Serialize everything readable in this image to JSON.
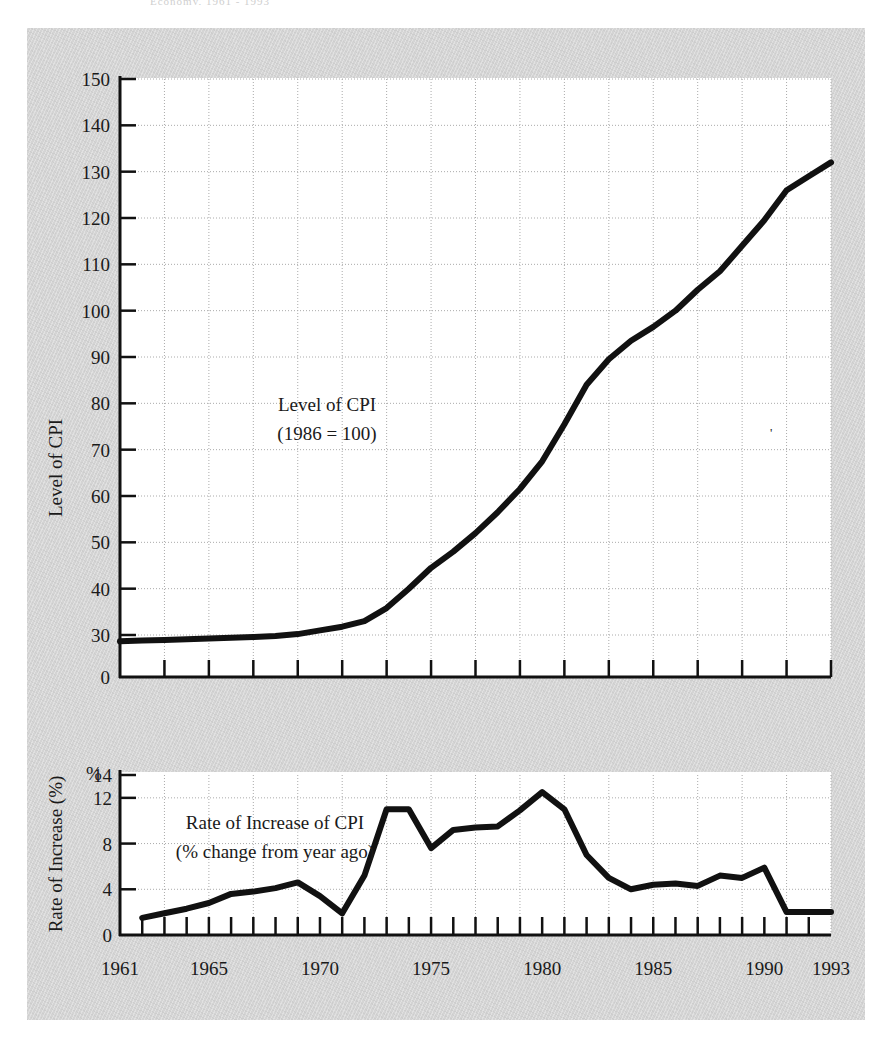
{
  "figure": {
    "cut_off_header": "Economy, 1961 - 1993",
    "background_color": "#d4d4d4",
    "plot_background": "#ffffff",
    "line_color": "#111111",
    "grid_color": "#aaaaaa"
  },
  "chart_data": [
    {
      "id": "level-of-cpi",
      "type": "line",
      "title": "Level of CPI",
      "subtitle": "(1986 = 100)",
      "xlabel": "",
      "ylabel": "Level of CPI",
      "ylim": [
        0,
        150
      ],
      "y_break_note": "axis compressed between 0 and 30",
      "yticks": [
        0,
        30,
        40,
        50,
        60,
        70,
        80,
        90,
        100,
        110,
        120,
        130,
        140,
        150
      ],
      "ytick_labels": [
        "0",
        "30",
        "40",
        "50",
        "60",
        "70",
        "80",
        "90",
        "100",
        "110",
        "120",
        "130",
        "140",
        "150"
      ],
      "xlim": [
        1961,
        1993
      ],
      "xticks": [
        1961,
        1963,
        1965,
        1967,
        1969,
        1971,
        1973,
        1975,
        1977,
        1979,
        1981,
        1983,
        1985,
        1987,
        1989,
        1991,
        1993
      ],
      "xtick_labels": [
        "1961",
        "",
        "1965",
        "",
        "",
        "",
        "",
        "1975",
        "",
        "",
        "",
        "",
        "1985",
        "",
        "",
        "",
        "1993"
      ],
      "grid": true,
      "x": [
        1961,
        1962,
        1963,
        1964,
        1965,
        1966,
        1967,
        1968,
        1969,
        1970,
        1971,
        1972,
        1973,
        1974,
        1975,
        1976,
        1977,
        1978,
        1979,
        1980,
        1981,
        1982,
        1983,
        1984,
        1985,
        1986,
        1987,
        1988,
        1989,
        1990,
        1991,
        1992,
        1993
      ],
      "values": [
        25.5,
        26.0,
        26.5,
        27.0,
        27.4,
        28.0,
        28.6,
        29.3,
        30.2,
        31.0,
        31.8,
        33.0,
        35.8,
        40.0,
        44.5,
        48.0,
        52.0,
        56.5,
        61.5,
        67.5,
        75.5,
        84.0,
        89.5,
        93.5,
        96.5,
        100.0,
        104.5,
        108.5,
        114.0,
        119.5,
        126.0,
        129.0,
        132.0
      ]
    },
    {
      "id": "rate-of-increase-of-cpi",
      "type": "line",
      "title": "Rate of Increase  of CPI",
      "subtitle": "(% change from year ago)",
      "xlabel": "",
      "ylabel": "Rate of Increase (%)",
      "unit_marker": "%",
      "ylim": [
        0,
        14
      ],
      "yticks": [
        0,
        4,
        8,
        12,
        14
      ],
      "ytick_labels": [
        "0",
        "4",
        "8",
        "12",
        "14"
      ],
      "xlim": [
        1961,
        1993
      ],
      "xticks": [
        1961,
        1962,
        1963,
        1964,
        1965,
        1966,
        1967,
        1968,
        1969,
        1970,
        1971,
        1972,
        1973,
        1974,
        1975,
        1976,
        1977,
        1978,
        1979,
        1980,
        1981,
        1982,
        1983,
        1984,
        1985,
        1986,
        1987,
        1988,
        1989,
        1990,
        1991,
        1992,
        1993
      ],
      "grid": true,
      "x": [
        1962,
        1963,
        1964,
        1965,
        1966,
        1967,
        1968,
        1969,
        1970,
        1971,
        1972,
        1973,
        1974,
        1975,
        1976,
        1977,
        1978,
        1979,
        1980,
        1981,
        1982,
        1983,
        1984,
        1985,
        1986,
        1987,
        1988,
        1989,
        1990,
        1991,
        1992,
        1993
      ],
      "values": [
        1.5,
        1.9,
        2.3,
        2.8,
        3.6,
        3.8,
        4.1,
        4.6,
        3.4,
        1.9,
        5.2,
        11.0,
        11.0,
        7.6,
        9.2,
        9.4,
        9.5,
        10.9,
        12.5,
        11.0,
        7.0,
        5.0,
        4.0,
        4.4,
        4.5,
        4.3,
        5.2,
        5.0,
        5.9,
        2.0,
        2.0,
        2.0
      ]
    }
  ],
  "upper_chart": {
    "axis_title": "Level of CPI",
    "annotation_line1": "Level of CPI",
    "annotation_line2": "(1986 = 100)"
  },
  "lower_chart": {
    "axis_title": "Rate of Increase (%)",
    "percent_marker": "%",
    "annotation_line1": "Rate of Increase  of CPI",
    "annotation_line2": "(% change from year ago)"
  }
}
